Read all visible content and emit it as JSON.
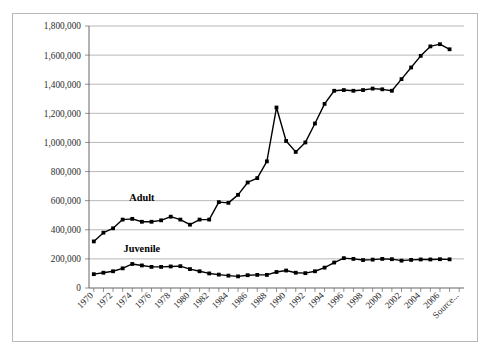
{
  "chart_data": {
    "type": "line",
    "title": "",
    "subtitle": "",
    "xlabel": "",
    "ylabel": "",
    "grid": true,
    "legend_position": "inline-annotation",
    "ylim": [
      0,
      1800000
    ],
    "ytick_interval": 200000,
    "ytick_labels": [
      "1,800,000",
      "1,600,000",
      "1,400,000",
      "1,200,000",
      "1,000,000",
      "800,000",
      "600,000",
      "400,000",
      "200,000",
      "0"
    ],
    "ytick_values": [
      1800000,
      1600000,
      1400000,
      1200000,
      1000000,
      800000,
      600000,
      400000,
      200000,
      0
    ],
    "x": [
      1970,
      1971,
      1972,
      1973,
      1974,
      1975,
      1976,
      1977,
      1978,
      1979,
      1980,
      1981,
      1982,
      1983,
      1984,
      1985,
      1986,
      1987,
      1988,
      1989,
      1990,
      1991,
      1992,
      1993,
      1994,
      1995,
      1996,
      1997,
      1998,
      1999,
      2000,
      2001,
      2002,
      2003,
      2004,
      2005,
      2006,
      2007
    ],
    "xtick_labels": [
      "1970",
      "1972",
      "1974",
      "1976",
      "1978",
      "1980",
      "1982",
      "1984",
      "1986",
      "1988",
      "1990",
      "1992",
      "1994",
      "1996",
      "1998",
      "2000",
      "2002",
      "2004",
      "2006",
      "Source..."
    ],
    "xtick_label_interval": 2,
    "series": [
      {
        "name": "Adult",
        "color": "#000000",
        "marker": "square",
        "values": [
          320000,
          380000,
          410000,
          470000,
          475000,
          455000,
          455000,
          465000,
          490000,
          470000,
          435000,
          470000,
          470000,
          590000,
          585000,
          640000,
          725000,
          755000,
          870000,
          1240000,
          1010000,
          935000,
          1000000,
          1130000,
          1265000,
          1355000,
          1360000,
          1355000,
          1360000,
          1370000,
          1365000,
          1355000,
          1435000,
          1515000,
          1595000,
          1660000,
          1675000,
          1640000
        ]
      },
      {
        "name": "Juvenile",
        "color": "#000000",
        "marker": "square",
        "values": [
          95000,
          105000,
          115000,
          135000,
          165000,
          155000,
          145000,
          145000,
          148000,
          150000,
          130000,
          115000,
          100000,
          92000,
          85000,
          80000,
          88000,
          90000,
          90000,
          110000,
          120000,
          105000,
          102000,
          115000,
          140000,
          175000,
          205000,
          200000,
          192000,
          195000,
          200000,
          198000,
          188000,
          193000,
          196000,
          196000,
          198000,
          197000
        ]
      }
    ],
    "annotations": [
      {
        "text": "Adult",
        "series": "Adult",
        "x_at": 1975,
        "y_at": 600000
      },
      {
        "text": "Juvenile",
        "series": "Juvenile",
        "x_at": 1975,
        "y_at": 245000
      }
    ]
  }
}
